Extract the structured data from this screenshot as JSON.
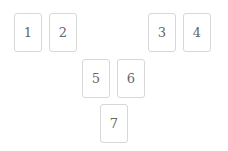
{
  "cards": [
    {
      "label": "1"
    },
    {
      "label": "2"
    },
    {
      "label": "3"
    },
    {
      "label": "4"
    },
    {
      "label": "5"
    },
    {
      "label": "6"
    },
    {
      "label": "7"
    }
  ]
}
